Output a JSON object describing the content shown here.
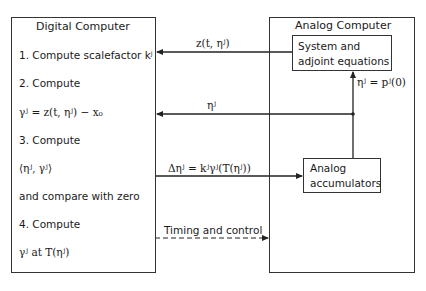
{
  "digital_computer": {
    "title": "Digital Computer",
    "steps": [
      {
        "label": "1. Compute scalefactor kʲ"
      },
      {
        "label": "2. Compute"
      },
      {
        "label": "γʲ = z(t, ηʲ) − x₀"
      },
      {
        "label": "3. Compute"
      },
      {
        "label": "⟨ηʲ, γʲ⟩"
      },
      {
        "label": "and compare with zero"
      },
      {
        "label": "4. Compute"
      },
      {
        "label": "γʲ at T(ηʲ)"
      }
    ]
  },
  "analog_computer": {
    "title": "Analog Computer",
    "system_block": {
      "line1": "System and",
      "line2": "adjoint equations"
    },
    "accumulator_block": {
      "line1": "Analog",
      "line2": "accumulators"
    }
  },
  "signals": {
    "z_signal": "z(t, ηʲ)",
    "eta_signal": "ηʲ",
    "eta_init": "ηʲ = pʲ(0)",
    "delta_eta": "Δηʲ = kʲγʲ(T(ηʲ))",
    "timing": "Timing and control"
  }
}
